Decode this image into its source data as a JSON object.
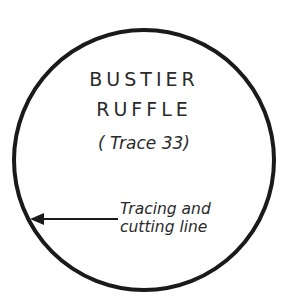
{
  "pattern": {
    "title_line1": "BUSTIER",
    "title_line2": "RUFFLE",
    "subtitle": "( Trace 33)"
  },
  "annotation": {
    "line1": "Tracing and",
    "line2": "cutting line"
  },
  "colors": {
    "stroke": "#1a1a1a",
    "text": "#2a2a2a",
    "background": "#ffffff"
  }
}
